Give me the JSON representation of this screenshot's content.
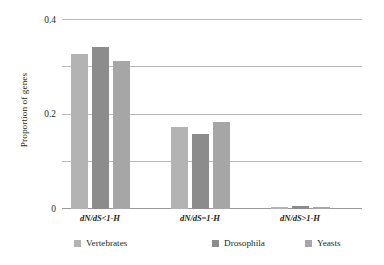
{
  "chart_data": {
    "type": "bar",
    "title": "",
    "xlabel": "",
    "ylabel": "Proportion of genes",
    "ylim": [
      0,
      0.8
    ],
    "yticks": [
      "0",
      "0.2",
      "0.4",
      "0.6",
      "0.8"
    ],
    "ytick_values": [
      0,
      0.2,
      0.4,
      0.6,
      0.8
    ],
    "grid": true,
    "legend_position": "bottom",
    "categories": [
      "dN/dS<1-H",
      "dN/dS=1-H",
      "dN/dS>1-H"
    ],
    "series": [
      {
        "name": "Vertebrates",
        "color": "#b3b3b3",
        "values": [
          0.655,
          0.347,
          0.008
        ]
      },
      {
        "name": "Drosophila",
        "color": "#8c8c8c",
        "values": [
          0.686,
          0.317,
          0.011
        ]
      },
      {
        "name": "Yeasts",
        "color": "#a6a6a6",
        "values": [
          0.625,
          0.37,
          0.009
        ]
      }
    ]
  },
  "axis": {
    "y_title": "Proportion of genes"
  },
  "legend": {
    "items": [
      {
        "label": "Vertebrates"
      },
      {
        "label": "Drosophila"
      },
      {
        "label": "Yeasts"
      }
    ]
  }
}
